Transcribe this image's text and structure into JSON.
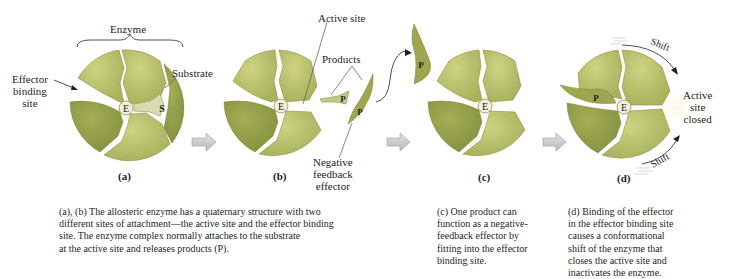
{
  "colors": {
    "enzyme_light": "#b9c06c",
    "enzyme_dark": "#8f9a45",
    "enzyme_edge": "#7f8a3c",
    "product": "#9fa64f",
    "substrate": "#d9dbb0",
    "e_circle": "#f1f0dc",
    "process_arrow": "#c8c8c8",
    "text": "#231f20"
  },
  "labels": {
    "enzyme": "Enzyme",
    "effector_binding_site": [
      "Effector",
      "binding",
      "site"
    ],
    "substrate": "Substrate",
    "substrate_letter": "S",
    "e_letter": "E",
    "active_site": "Active site",
    "products": "Products",
    "product_letter": "P",
    "negative_feedback_effector": [
      "Negative",
      "feedback",
      "effector"
    ],
    "shift": "Shift",
    "active_site_closed": [
      "Active",
      "site",
      "closed"
    ]
  },
  "panels": [
    {
      "id": "a",
      "letter": "(a)"
    },
    {
      "id": "b",
      "letter": "(b)"
    },
    {
      "id": "c",
      "letter": "(c)"
    },
    {
      "id": "d",
      "letter": "(d)"
    }
  ],
  "captions": {
    "ab": "(a), (b) The allosteric enzyme has a quaternary structure with two different sites of attachment—the active site and the effector binding site. The enzyme complex normally attaches to the substrate at the active site and releases products (P).",
    "ab_lines": [
      "(a), (b) The allosteric enzyme has a quaternary structure with two",
      "different sites of attachment—the active site and the effector binding",
      "site. The enzyme complex normally attaches to the substrate",
      "at the active site and releases products (P)."
    ],
    "c_lines": [
      "(c) One product can",
      "function as a negative-",
      "feedback effector by",
      "fitting into the effector",
      "binding site."
    ],
    "d_lines": [
      "(d) Binding of the effector",
      "in the effector binding site",
      "causes a conformational",
      "shift of the enzyme that",
      "closes the active site and",
      "inactivates the enzyme."
    ]
  }
}
